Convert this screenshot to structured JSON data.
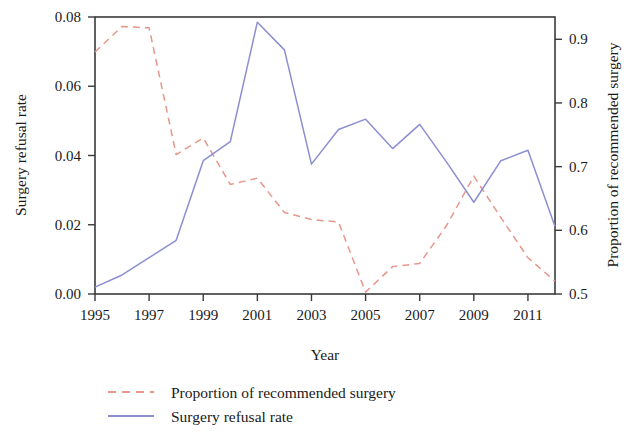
{
  "chart_data": {
    "type": "line",
    "title": "",
    "xlabel": "Year",
    "ylabel": "Surgery refusal rate",
    "y2label": "Proportion of recommended surgery",
    "x": [
      1995,
      1996,
      1997,
      1998,
      1999,
      2000,
      2001,
      2002,
      2003,
      2004,
      2005,
      2006,
      2007,
      2008,
      2009,
      2010,
      2011,
      2012
    ],
    "xlim": [
      1995,
      2012
    ],
    "ylim": [
      0.0,
      0.08
    ],
    "y2lim": [
      0.5,
      0.935
    ],
    "xticks": [
      1995,
      1997,
      1999,
      2001,
      2003,
      2005,
      2007,
      2009,
      2011
    ],
    "xtick_labels": [
      "1995",
      "1997",
      "1999",
      "2001",
      "2003",
      "2005",
      "2007",
      "2009",
      "2011"
    ],
    "yticks": [
      0.0,
      0.02,
      0.04,
      0.06,
      0.08
    ],
    "ytick_labels": [
      "0.00",
      "0.02",
      "0.04",
      "0.06",
      "0.08"
    ],
    "y2ticks": [
      0.5,
      0.6,
      0.7,
      0.8,
      0.9
    ],
    "y2tick_labels": [
      "0.5",
      "0.6",
      "0.7",
      "0.8",
      "0.9"
    ],
    "grid": false,
    "legend_position": "below",
    "series": [
      {
        "name": "Proportion of recommended surgery",
        "axis": "right",
        "color": "#e8968a",
        "style": "dashed",
        "values": [
          0.88,
          0.92,
          0.918,
          0.719,
          0.745,
          0.672,
          0.682,
          0.628,
          0.617,
          0.613,
          0.503,
          0.543,
          0.548,
          0.608,
          0.685,
          0.62,
          0.557,
          0.52
        ]
      },
      {
        "name": "Surgery refusal rate",
        "axis": "left",
        "color": "#8b8fd0",
        "style": "solid",
        "values": [
          0.002,
          0.0055,
          0.0105,
          0.0155,
          0.0385,
          0.044,
          0.0785,
          0.0705,
          0.0375,
          0.0475,
          0.0505,
          0.042,
          0.049,
          0.038,
          0.0265,
          0.0385,
          0.0415,
          0.0195
        ]
      }
    ]
  },
  "legend": {
    "items": [
      {
        "label": "Proportion of recommended surgery",
        "color": "#e8968a",
        "style": "dashed"
      },
      {
        "label": "Surgery refusal rate",
        "color": "#8b8fd0",
        "style": "solid"
      }
    ]
  },
  "axes": {
    "x_title": "Year",
    "y_left_title": "Surgery refusal rate",
    "y_right_title": "Proportion of recommended surgery"
  }
}
